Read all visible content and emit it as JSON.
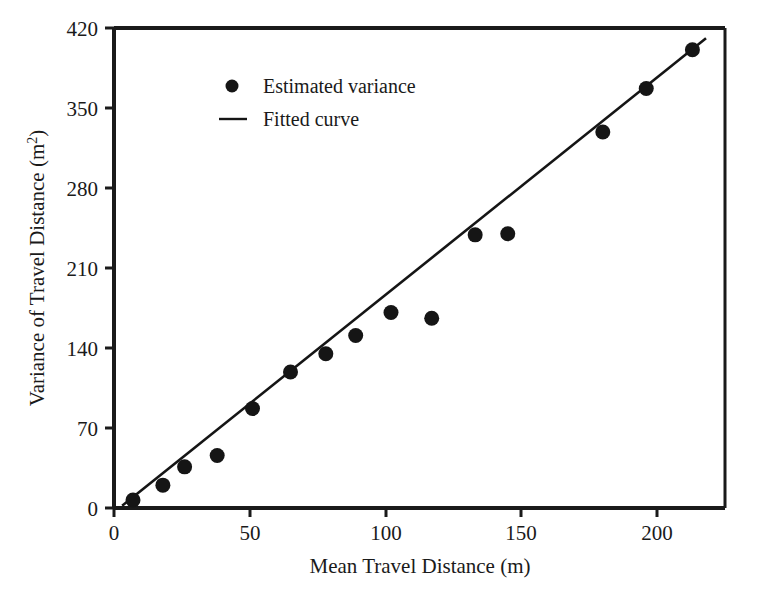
{
  "chart_data": {
    "type": "scatter",
    "title": "",
    "subtitle": "",
    "xlabel": "Mean Travel Distance (m)",
    "ylabel": "Variance of Travel Distance (m²)",
    "ylabel_base": "Variance of Travel Distance (m",
    "ylabel_sup": "2",
    "ylabel_close": ")",
    "xlim": [
      0,
      225
    ],
    "ylim": [
      0,
      420
    ],
    "xticks": [
      0,
      50,
      100,
      150,
      200
    ],
    "yticks": [
      0,
      70,
      140,
      210,
      280,
      350,
      420
    ],
    "xtick_labels": [
      "0",
      "50",
      "100",
      "150",
      "200"
    ],
    "ytick_labels": [
      "0",
      "70",
      "140",
      "210",
      "280",
      "350",
      "420"
    ],
    "grid": false,
    "legend_position": "top-left-inside",
    "marker_color": "#151515",
    "line_color": "#151515",
    "axis_color": "#1a1a1a",
    "background_color": "#ffffff",
    "series": [
      {
        "name": "Estimated variance",
        "type": "scatter",
        "marker": "circle",
        "color": "#151515",
        "x": [
          7,
          18,
          26,
          38,
          51,
          65,
          78,
          89,
          102,
          117,
          133,
          145,
          180,
          196,
          213
        ],
        "y": [
          7,
          20,
          36,
          46,
          87,
          119,
          135,
          151,
          171,
          166,
          239,
          240,
          329,
          367,
          401
        ]
      },
      {
        "name": "Fitted curve",
        "type": "line",
        "color": "#151515",
        "x": [
          3,
          218
        ],
        "y": [
          2,
          411
        ]
      }
    ],
    "legend": [
      {
        "label": "Estimated variance",
        "marker": "circle",
        "color": "#151515"
      },
      {
        "label": "Fitted curve",
        "marker": "line",
        "color": "#151515"
      }
    ]
  }
}
